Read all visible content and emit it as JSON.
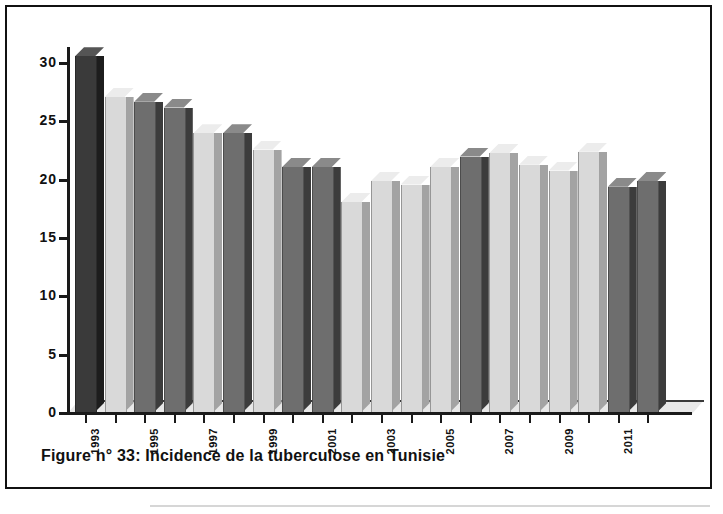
{
  "caption": "Figure n°  33: Incidence de la tuberculose en Tunisie",
  "chart_data": {
    "type": "bar",
    "title": "Figure n°  33: Incidence de la tuberculose en Tunisie",
    "xlabel": "",
    "ylabel": "",
    "ylim": [
      0,
      30
    ],
    "yticks": [
      0,
      5,
      10,
      15,
      20,
      25,
      30
    ],
    "ytick_labels": [
      "0",
      "5",
      "10",
      "15",
      "20",
      "25",
      "30"
    ],
    "grid": false,
    "legend": "none",
    "three_d": true,
    "categories": [
      "1993",
      "1994",
      "1995",
      "1996",
      "1997",
      "1998",
      "1999",
      "2000",
      "2001",
      "2002",
      "2003",
      "2004",
      "2005",
      "2006",
      "2007",
      "2008",
      "2009",
      "2010",
      "2011",
      "2012"
    ],
    "xtick_labels_shown": [
      "1993",
      "1995",
      "1997",
      "1999",
      "2001",
      "2003",
      "2005",
      "2007",
      "2009",
      "2011"
    ],
    "values": [
      30.5,
      27.0,
      26.6,
      26.1,
      23.9,
      23.9,
      22.5,
      21.0,
      21.0,
      18.0,
      19.8,
      19.5,
      21.0,
      21.9,
      22.2,
      21.2,
      20.7,
      22.3,
      19.3,
      19.8
    ],
    "bar_shades": [
      "dark",
      "light",
      "dark",
      "dark",
      "light",
      "dark",
      "light",
      "dark",
      "dark",
      "light",
      "light",
      "light",
      "light",
      "dark",
      "light",
      "light",
      "light",
      "light",
      "dark",
      "dark"
    ]
  },
  "colors": {
    "bar_dark_front": "#6e6e6e",
    "bar_dark_side": "#3c3c3c",
    "bar_dark_top": "#8a8a8a",
    "bar_light_front": "#d9d9d9",
    "bar_light_side": "#a3a3a3",
    "bar_light_top": "#ececec",
    "bar_first_front": "#3a3a3a",
    "bar_first_side": "#1d1d1d",
    "bar_first_top": "#555555",
    "axis": "#1a1a1a",
    "frame": "#111111",
    "background": "#ffffff"
  }
}
